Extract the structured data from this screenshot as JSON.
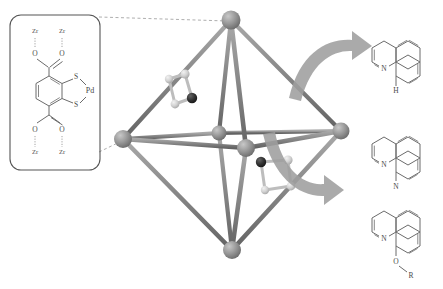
{
  "figure": {
    "background_color": "#ffffff"
  },
  "linker_box": {
    "name": "pd-dithiolene-linker-structure",
    "atom_labels": {
      "zr_top_left": "Zr",
      "zr_top_right": "Zr",
      "o_top_left": "O",
      "o_top_right": "O",
      "s_upper": "S",
      "s_lower": "S",
      "pd": "Pd",
      "o_bottom_left": "O",
      "o_bottom_right": "O",
      "zr_bottom_left": "Zr",
      "zr_bottom_right": "Zr"
    },
    "stroke_color": "#6b6b6b",
    "border_color": "#555555"
  },
  "cluster": {
    "name": "octahedral-metal-cluster",
    "vertex_count": 6,
    "vertex_color": "#8c8c8c",
    "edge_color": "#7d7d7d",
    "ligand_dark_atom_color": "#2b2b2b",
    "ligand_light_atom_color": "#d0d0d0",
    "ligand_count": 2
  },
  "arrows": {
    "upper": {
      "name": "curved-arrow-upper",
      "color": "#9a9a9a"
    },
    "lower": {
      "name": "curved-arrow-lower",
      "color": "#9a9a9a"
    }
  },
  "products": [
    {
      "name": "benzo-quinoline-ch",
      "substituent_label": "H",
      "nitrogen_label": "N"
    },
    {
      "name": "benzo-quinoline-n",
      "substituent_label": "N",
      "nitrogen_label": "N"
    },
    {
      "name": "benzo-quinoline-or",
      "substituent_label": "O",
      "substituent_label_2": "R",
      "nitrogen_label": "N"
    }
  ]
}
